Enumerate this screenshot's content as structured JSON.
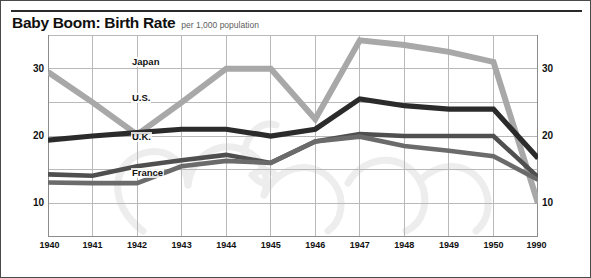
{
  "header": {
    "title": "Baby Boom: Birth Rate",
    "subtitle": "per 1,000 population"
  },
  "colors": {
    "japan": "#a8a8a8",
    "us": "#2b2b2b",
    "uk": "#4f4f4f",
    "france": "#6b6b6b",
    "grid": "#b9b9b9",
    "axis": "#8c8c8c",
    "frame": "#4a4a4a",
    "text": "#101010",
    "subtitle": "#5d5d5d",
    "watermark": "#ededed"
  },
  "axes": {
    "y_labels_left": [
      "30",
      "20",
      "10"
    ],
    "y_labels_right": [
      "30",
      "20",
      "10"
    ],
    "x_labels": [
      "1940",
      "1941",
      "1942",
      "1943",
      "1944",
      "1945",
      "1946",
      "1947",
      "1948",
      "1949",
      "1950",
      "1990"
    ]
  },
  "series_labels": {
    "japan": "Japan",
    "us": "U.S.",
    "uk": "U.K.",
    "france": "France"
  },
  "chart_data": {
    "type": "line",
    "title": "Baby Boom: Birth Rate",
    "subtitle": "per 1,000 population",
    "xlabel": "",
    "ylabel": "per 1,000 population",
    "categories": [
      "1940",
      "1941",
      "1942",
      "1943",
      "1944",
      "1945",
      "1946",
      "1947",
      "1948",
      "1949",
      "1950",
      "1990"
    ],
    "ylim": [
      5,
      35
    ],
    "yticks": [
      10,
      20,
      30
    ],
    "ygrid": [
      5,
      10,
      15,
      20,
      25,
      30,
      35
    ],
    "grid": true,
    "legend": "inline-labels",
    "note": "X axis is not linear: 1940-1950 are evenly spaced annual steps, then a single jump to 1990.",
    "series": [
      {
        "name": "Japan",
        "color": "#a8a8a8",
        "values": [
          29.5,
          25.0,
          20.2,
          25.0,
          30.0,
          30.0,
          22.5,
          34.2,
          33.5,
          32.5,
          31.0,
          10.0
        ]
      },
      {
        "name": "U.S.",
        "color": "#2b2b2b",
        "values": [
          19.4,
          20.0,
          20.5,
          21.0,
          21.0,
          20.0,
          21.0,
          25.5,
          24.5,
          24.0,
          24.0,
          16.7
        ]
      },
      {
        "name": "U.K.",
        "color": "#4f4f4f",
        "values": [
          14.3,
          14.1,
          15.5,
          16.4,
          17.2,
          16.0,
          19.2,
          20.3,
          20.0,
          20.0,
          20.0,
          13.9
        ]
      },
      {
        "name": "France",
        "color": "#6b6b6b",
        "values": [
          13.1,
          13.0,
          13.0,
          15.5,
          16.3,
          16.0,
          19.2,
          19.9,
          18.5,
          17.8,
          17.0,
          13.5
        ]
      }
    ]
  }
}
